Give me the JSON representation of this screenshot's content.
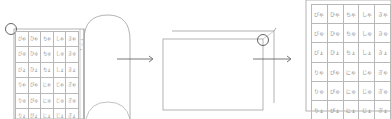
{
  "diagram": {
    "colors": {
      "line": "#9a9a9a",
      "arrow": "#555555",
      "text": "#8a8a8a",
      "grid": "#b8b8b8"
    },
    "step1": {
      "label": "open-booklet",
      "side_text": "↑ ー ↓",
      "table": [
        [
          "びゃ",
          "ひゃ",
          "ちゃ",
          "しゃ",
          "きゃ"
        ],
        [
          "びゅ",
          "ひゅ",
          "ちゅ",
          "しゅ",
          "きゅ"
        ],
        [
          "びょ",
          "ひょ",
          "ちょ",
          "しょ",
          "きょ"
        ],
        [
          "りゃ",
          "ぴゃ",
          "にゃ",
          "じゃ",
          "ぎゃ"
        ],
        [
          "りゅ",
          "ぴゅ",
          "にゅ",
          "じゅ",
          "ぎゅ"
        ],
        [
          "りょ",
          "ぴょ",
          "にょ",
          "じょ",
          "ぎょ"
        ]
      ]
    },
    "step2": {
      "label": "folded-sheet"
    },
    "step3": {
      "label": "final-table",
      "table": [
        [
          "びゃ",
          "ひゃ",
          "ちゃ",
          "しゃ",
          "きゃ"
        ],
        [
          "びゅ",
          "ひゅ",
          "ちゅ",
          "しゅ",
          "きゅ"
        ],
        [
          "びょ",
          "ひょ",
          "ちょ",
          "しょ",
          "きょ"
        ],
        [
          "りゃ",
          "ぴゃ",
          "にゃ",
          "じゃ",
          "ぎゃ"
        ],
        [
          "りゅ",
          "ぴゅ",
          "にゅ",
          "じゅ",
          "ぎゅ"
        ],
        [
          "りょ",
          "ぴょ",
          "にょ",
          "じょ",
          "ぎょ"
        ]
      ]
    }
  }
}
